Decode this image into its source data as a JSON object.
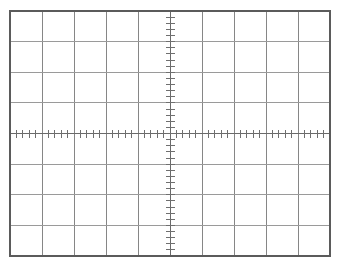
{
  "app": {
    "title": "Oscilloscope Graticule"
  },
  "chart_data": {
    "type": "grid",
    "title": "",
    "subtitle": "",
    "xlabel": "",
    "ylabel": "",
    "divisions_x": 10,
    "divisions_y": 8,
    "subdivisions_per_division": 5,
    "grid": true,
    "legend": "none",
    "series": [],
    "values": [],
    "categories": [],
    "xlim": [
      -5,
      5
    ],
    "ylim": [
      -4,
      4
    ],
    "x_tick_labels": [],
    "y_tick_labels": [],
    "annotations": []
  },
  "graticule": {
    "name": "graticule",
    "left": 10,
    "top": 11,
    "right": 330,
    "bottom": 256,
    "width": 320,
    "height": 245,
    "cols": 10,
    "rows": 8,
    "cell_width": 32,
    "cell_height": 30.625,
    "center_x": 170,
    "center_y": 133.625,
    "subticks_per_div": 5,
    "h_axis_minor_tick_len": 4,
    "h_axis_major_tick_len": 7,
    "v_axis_minor_tick_len": 4,
    "v_axis_major_tick_len": 7,
    "v_axis_tick_half_width": 4.5
  },
  "colors": {
    "background": "#ffffff",
    "border": "#5b5b5b",
    "gridline": "#868686",
    "gridline_light": "#9a9a9a",
    "centerline": "#6a6a6a",
    "tick": "#6f6f6f"
  },
  "strokes": {
    "border_width": 1.1,
    "gridline_width": 1.0,
    "centerline_width": 1.0,
    "tick_width": 1.0
  }
}
